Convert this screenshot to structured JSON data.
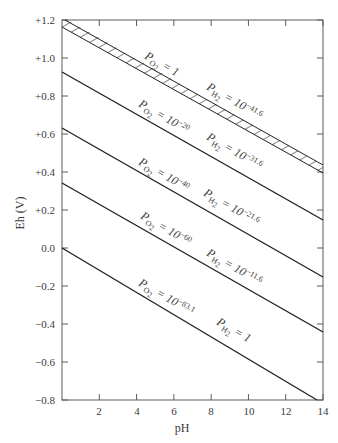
{
  "chart_data": {
    "type": "line",
    "title": "",
    "xlabel": "pH",
    "ylabel": "Eh (V)",
    "xlim": [
      0,
      14
    ],
    "ylim": [
      -0.8,
      1.2
    ],
    "grid": false,
    "legend": "none (inline labels along lines)",
    "x_ticks": [
      2,
      4,
      6,
      8,
      10,
      12,
      14
    ],
    "x_tick_labels": [
      "2",
      "4",
      "6",
      "8",
      "10",
      "12",
      "14"
    ],
    "y_ticks": [
      1.2,
      1.0,
      0.8,
      0.6,
      0.4,
      0.2,
      0.0,
      -0.2,
      -0.4,
      -0.6,
      -0.8
    ],
    "y_tick_labels": [
      "+1.2",
      "+1.0",
      "+0.8",
      "+0.6",
      "+0.4",
      "+0.2",
      "0.0",
      "−0.2",
      "−0.4",
      "−0.6",
      "−0.8"
    ],
    "series": [
      {
        "name": "P_O2 = 1 / P_H2 = 10^-41.6 (hatched band, water oxidation limit)",
        "style": "hatched-band",
        "x": [
          0,
          14
        ],
        "y_upper": [
          1.23,
          0.4
        ],
        "y_lower": [
          1.19,
          0.36
        ],
        "labels": {
          "o2": "P_O2 = 1",
          "h2": "P_H2 = 10^-41.6"
        }
      },
      {
        "name": "P_O2 = 10^-20 / P_H2 = 10^-31.6",
        "x": [
          0,
          14
        ],
        "y": [
          0.93,
          0.14
        ],
        "labels": {
          "o2": "P_O2 = 10^-20",
          "h2": "P_H2 = 10^-31.6"
        }
      },
      {
        "name": "P_O2 = 10^-40 / P_H2 = 10^-21.6",
        "x": [
          0,
          14
        ],
        "y": [
          0.63,
          -0.15
        ],
        "labels": {
          "o2": "P_O2 = 10^-40",
          "h2": "P_H2 = 10^-21.6"
        }
      },
      {
        "name": "P_O2 = 10^-60 / P_H2 = 10^-11.6",
        "x": [
          0,
          14
        ],
        "y": [
          0.34,
          -0.44
        ],
        "labels": {
          "o2": "P_O2 = 10^-60",
          "h2": "P_H2 = 10^-11.6"
        }
      },
      {
        "name": "P_O2 = 10^-83.1 / P_H2 = 1 (water reduction limit)",
        "x": [
          0,
          13.7
        ],
        "y": [
          0.0,
          -0.8
        ],
        "labels": {
          "o2": "P_O2 = 10^-83.1",
          "h2": "P_H2 = 1"
        }
      }
    ]
  },
  "labels": {
    "xlabel": "pH",
    "ylabel": "Eh (V)",
    "x_ticks": [
      "2",
      "4",
      "6",
      "8",
      "10",
      "12",
      "14"
    ],
    "y_ticks": [
      "+1.2",
      "+1.0",
      "+0.8",
      "+0.6",
      "+0.4",
      "+0.2",
      "0.0",
      "−0.2",
      "−0.4",
      "−0.6",
      "−0.8"
    ],
    "curves": [
      {
        "o2_exp": "",
        "o2_val": "1",
        "h2_exp": "−41.6",
        "h2_base": "10"
      },
      {
        "o2_exp": "−20",
        "o2_base": "10",
        "h2_exp": "−31.6",
        "h2_base": "10"
      },
      {
        "o2_exp": "−40",
        "o2_base": "10",
        "h2_exp": "−21.6",
        "h2_base": "10"
      },
      {
        "o2_exp": "−60",
        "o2_base": "10",
        "h2_exp": "−11.6",
        "h2_base": "10"
      },
      {
        "o2_exp": "−83.1",
        "o2_base": "10",
        "h2_exp": "",
        "h2_val": "1"
      }
    ],
    "p": "P",
    "o2_sub": "O",
    "o2_sub2": "2",
    "h2_sub": "H",
    "h2_sub2": "2",
    "eq": "="
  },
  "colors": {
    "axis": "#5a5a5a",
    "line": "#222222",
    "text": "#3a3a3a",
    "background": "#ffffff"
  }
}
